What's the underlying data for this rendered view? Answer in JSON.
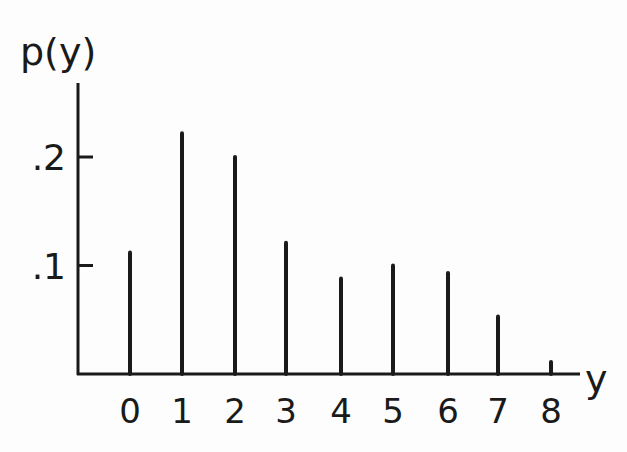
{
  "chart_data": {
    "type": "bar",
    "style": "stem",
    "title": "",
    "xlabel": "y",
    "ylabel": "p(y)",
    "categories": [
      "0",
      "1",
      "2",
      "3",
      "4",
      "5",
      "6",
      "7",
      "8"
    ],
    "values": [
      0.112,
      0.222,
      0.2,
      0.121,
      0.088,
      0.1,
      0.093,
      0.053,
      0.011
    ],
    "ytick_labels": [
      ".1",
      ".2"
    ],
    "ytick_values": [
      0.1,
      0.2
    ],
    "ylim": [
      0,
      0.27
    ],
    "grid": false,
    "legend": null
  }
}
